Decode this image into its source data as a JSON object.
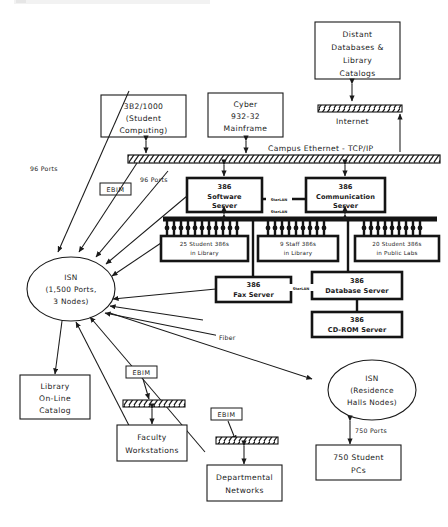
{
  "diagram": {
    "type": "network-diagram",
    "colors": {
      "ink": "#1a1a1a",
      "background": "#ffffff",
      "hatch": "#141414"
    }
  },
  "nodes": {
    "distant_databases": {
      "lines": [
        "Distant",
        "Databases &",
        "Library",
        "Catalogs"
      ]
    },
    "b3b2": {
      "lines": [
        "3B2/1000",
        "(Student",
        "Computing)"
      ]
    },
    "cyber": {
      "lines": [
        "Cyber",
        "932-32",
        "Mainframe"
      ]
    },
    "software_server": {
      "model": "386",
      "lines": [
        "Software",
        "Server"
      ]
    },
    "communication_server": {
      "model": "386",
      "lines": [
        "Communication",
        "Server"
      ]
    },
    "student_386s_library": {
      "lines": [
        "25 Student 386s",
        "in Library"
      ]
    },
    "staff_386s_library": {
      "lines": [
        "9 Staff 386s",
        "in Library"
      ]
    },
    "student_386s_labs": {
      "lines": [
        "20 Student 386s",
        "in Public Labs"
      ]
    },
    "fax_server": {
      "model": "386",
      "lines": [
        "Fax Server"
      ]
    },
    "database_server": {
      "model": "386",
      "lines": [
        "Database Server"
      ]
    },
    "cdrom_server": {
      "model": "386",
      "lines": [
        "CD-ROM Server"
      ]
    },
    "isn_main": {
      "lines": [
        "ISN",
        "(1,500 Ports,",
        "3 Nodes)"
      ]
    },
    "isn_residence": {
      "lines": [
        "ISN",
        "(Residence",
        "Halls Nodes)"
      ]
    },
    "library_catalog": {
      "lines": [
        "Library",
        "On-Line",
        "Catalog"
      ]
    },
    "faculty_workstations": {
      "lines": [
        "Faculty",
        "Workstations"
      ]
    },
    "departmental_networks": {
      "lines": [
        "Departmental",
        "Networks"
      ]
    },
    "student_pcs": {
      "lines": [
        "750 Student",
        "PCs"
      ]
    }
  },
  "buses": {
    "campus_ethernet": {
      "label": "Campus Ethernet - TCP/IP"
    },
    "internet": {
      "label": "Internet"
    },
    "starlan_backbone": {
      "label": "StarLAN"
    },
    "faculty_bus": {
      "label": ""
    },
    "departmental_bus": {
      "label": ""
    }
  },
  "links": {
    "starlan_1": "StarLAN",
    "starlan_2": "StarLAN",
    "starlan_3": "StarLAN",
    "fiber": "Fiber",
    "ports_96_a": "96 Ports",
    "ports_96_b": "96 Ports",
    "ports_750": "750 Ports"
  },
  "devices": {
    "ebim_1": "EBIM",
    "ebim_2": "EBIM",
    "ebim_3": "EBIM"
  }
}
